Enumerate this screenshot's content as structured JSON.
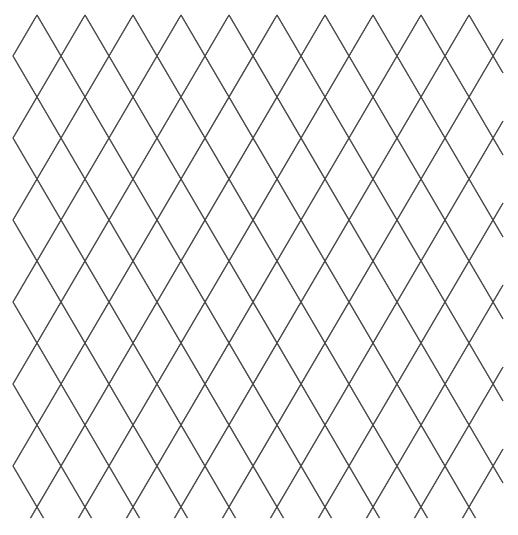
{
  "page": {
    "width": 518,
    "height": 535,
    "background_color": "#ffffff"
  },
  "pattern": {
    "name": "diamond-lattice",
    "description": "Regular argyle / diamond trellis grid of thin dark-gray crossing diagonal lines on a white background",
    "line_color": "#4a4a4a",
    "line_width": 1.1,
    "diamond_width": 48,
    "diamond_height": 82,
    "half_width": 24,
    "half_height": 41,
    "origin_x": 13,
    "origin_y": 15,
    "clip_left": 13,
    "clip_right": 503,
    "clip_top": 15,
    "clip_bottom": 518,
    "columns": 10,
    "rows": 6,
    "top_apex_count": 10,
    "bottom_vertex_count": 10,
    "first_top_apex_x": 37,
    "first_crossing_x": 37,
    "first_crossing_y": 97,
    "apex_spacing_x": 48,
    "crossing_spacing_y": 82
  },
  "chart_data": {
    "type": "scatter",
    "xlabel": "",
    "ylabel": "",
    "xlim": [
      13,
      503
    ],
    "ylim": [
      15,
      518
    ],
    "grid": false,
    "legend": null,
    "series": [
      {
        "name": "down-right-diagonals",
        "slope": -1.7083,
        "count": 17,
        "values": []
      },
      {
        "name": "down-left-diagonals",
        "slope": 1.7083,
        "count": 17,
        "values": []
      }
    ],
    "lattice_nodes_x": [
      13,
      37,
      61,
      85,
      109,
      133,
      157,
      181,
      205,
      229,
      253,
      277,
      301,
      325,
      349,
      373,
      397,
      421,
      445,
      469,
      493,
      503
    ],
    "lattice_nodes_y": [
      15,
      56,
      97,
      138,
      179,
      220,
      261,
      302,
      343,
      384,
      425,
      466,
      507,
      518
    ]
  }
}
